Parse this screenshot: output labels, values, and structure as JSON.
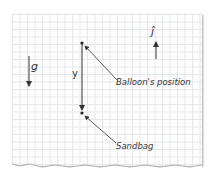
{
  "diagram": {
    "labels": {
      "gravity": "g",
      "unit_vector": "ĵ",
      "distance": "y",
      "balloon": "Balloon's position",
      "sandbag": "Sandbag"
    },
    "colors": {
      "ink": "#333333",
      "grid": "#e3e6ea",
      "paper": "#fdfdfd"
    }
  }
}
